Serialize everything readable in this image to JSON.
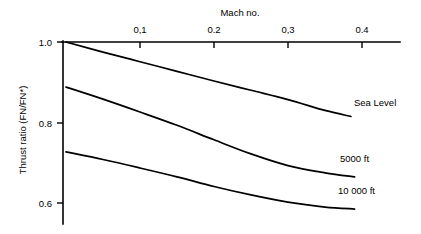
{
  "chart_data": {
    "type": "line",
    "title": "",
    "xlabel": "Mach no.",
    "ylabel": "Thrust ratio (FN/FN*)",
    "x_axis_position": "top",
    "xlim": [
      0,
      0.46
    ],
    "ylim": [
      0.55,
      1.02
    ],
    "xticks": [
      0.1,
      0.2,
      0.3,
      0.4
    ],
    "xtick_labels": [
      "0,1",
      "0.2",
      "0,3",
      "0.4"
    ],
    "yticks": [
      1.0,
      0.8,
      0.6
    ],
    "ytick_labels": [
      "1.0",
      "0.8",
      "0.6"
    ],
    "grid": false,
    "legend": "inline-right-labels",
    "series": [
      {
        "name": "Sea Level",
        "label": "Sea Level",
        "x": [
          0.0,
          0.05,
          0.1,
          0.15,
          0.2,
          0.25,
          0.3,
          0.35,
          0.385
        ],
        "y": [
          1.0,
          0.975,
          0.951,
          0.927,
          0.903,
          0.88,
          0.857,
          0.83,
          0.815
        ]
      },
      {
        "name": "5000 ft",
        "label": "5000 ft",
        "x": [
          0.0,
          0.05,
          0.1,
          0.15,
          0.2,
          0.25,
          0.3,
          0.35,
          0.39
        ],
        "y": [
          0.888,
          0.858,
          0.826,
          0.793,
          0.757,
          0.722,
          0.693,
          0.675,
          0.665
        ]
      },
      {
        "name": "10 000 ft",
        "label": "10 000 ft",
        "x": [
          0.0,
          0.05,
          0.1,
          0.15,
          0.2,
          0.25,
          0.3,
          0.35,
          0.39
        ],
        "y": [
          0.727,
          0.708,
          0.687,
          0.665,
          0.641,
          0.62,
          0.602,
          0.59,
          0.585
        ]
      }
    ],
    "colors": {
      "axis": "#000000",
      "curve": "#000000",
      "background": "#ffffff"
    }
  },
  "axes": {
    "x_title": "Mach no.",
    "y_title": "Thrust ratio (FN/FN*)",
    "x_tick_labels": [
      "0,1",
      "0.2",
      "0,3",
      "0.4"
    ],
    "y_tick_labels": [
      "1.0",
      "0.8",
      "0.6"
    ]
  },
  "series_labels": {
    "sea_level": "Sea Level",
    "ft_5000": "5000 ft",
    "ft_10000": "10 000 ft"
  }
}
